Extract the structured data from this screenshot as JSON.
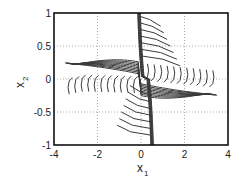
{
  "chart_data": {
    "type": "line",
    "title": "",
    "xlabel": "x",
    "xlabel_sub": "1",
    "ylabel": "x",
    "ylabel_sub": "2",
    "xlim": [
      -4,
      4
    ],
    "ylim": [
      -1,
      1
    ],
    "xticks": [
      -4,
      -2,
      0,
      2,
      4
    ],
    "yticks": [
      -1,
      -0.5,
      0,
      0.5,
      1
    ],
    "xtick_labels": [
      "-4",
      "-2",
      "0",
      "2",
      "4"
    ],
    "ytick_labels": [
      "-1",
      "-0.5",
      "0",
      "0.5",
      "1"
    ],
    "grid": true,
    "grid_style": "dotted",
    "legend": null,
    "line_color": "#333333",
    "series": [
      {
        "name": "shallow-band-upper-envelope",
        "x": [
          -3.5,
          -3,
          -2,
          -1,
          0,
          1,
          2,
          3,
          3.5
        ],
        "y": [
          0.05,
          0.25,
          0.28,
          0.2,
          0.02,
          -0.1,
          -0.2,
          -0.28,
          -0.3
        ]
      },
      {
        "name": "shallow-band-lower-envelope",
        "x": [
          -3.5,
          -3,
          -2,
          -1,
          0,
          1,
          2,
          3,
          3.5
        ],
        "y": [
          0.0,
          0.05,
          0.08,
          0.05,
          0.0,
          -0.05,
          -0.1,
          -0.15,
          -0.05
        ]
      },
      {
        "name": "steep-band-left",
        "x": [
          -0.1,
          -0.05,
          0.05,
          0.2,
          0.35,
          0.5
        ],
        "y": [
          1.0,
          0.6,
          0.2,
          -0.2,
          -0.6,
          -1.0
        ]
      },
      {
        "name": "steep-band-right",
        "x": [
          0.1,
          0.15,
          0.25,
          0.4,
          0.55,
          0.7
        ],
        "y": [
          1.0,
          0.6,
          0.2,
          -0.2,
          -0.6,
          -1.0
        ]
      }
    ]
  }
}
